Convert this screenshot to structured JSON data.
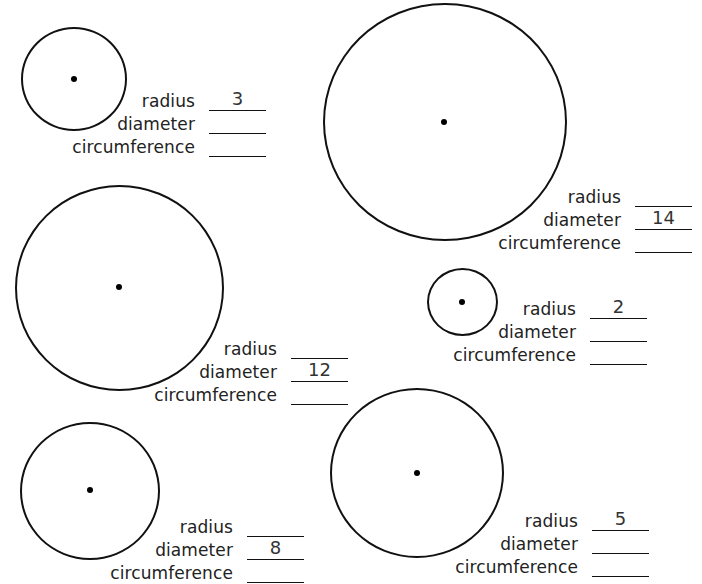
{
  "worksheet": {
    "labels": {
      "radius": "radius",
      "diameter": "diameter",
      "circumference": "circumference"
    },
    "problems": [
      {
        "id": 1,
        "radius": "3",
        "diameter": "",
        "circumference": ""
      },
      {
        "id": 2,
        "radius": "",
        "diameter": "14",
        "circumference": ""
      },
      {
        "id": 3,
        "radius": "",
        "diameter": "12",
        "circumference": ""
      },
      {
        "id": 4,
        "radius": "2",
        "diameter": "",
        "circumference": ""
      },
      {
        "id": 5,
        "radius": "",
        "diameter": "8",
        "circumference": ""
      },
      {
        "id": 6,
        "radius": "5",
        "diameter": "",
        "circumference": ""
      }
    ]
  }
}
